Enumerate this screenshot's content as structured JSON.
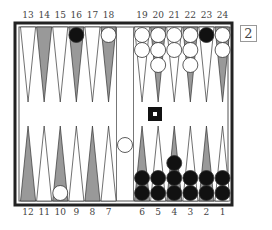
{
  "board": {
    "top_labels": [
      "13",
      "14",
      "15",
      "16",
      "17",
      "18",
      "19",
      "20",
      "21",
      "22",
      "23",
      "24"
    ],
    "bottom_labels": [
      "12",
      "11",
      "10",
      "9",
      "8",
      "7",
      "6",
      "5",
      "4",
      "3",
      "2",
      "1"
    ],
    "colors": {
      "frame": "#222222",
      "light_point": "#ffffff",
      "dark_point": "#999999",
      "white_checker": "#ffffff",
      "black_checker": "#111111",
      "background": "#ffffff"
    },
    "checkers": [
      {
        "point": 16,
        "color": "black",
        "count": 1
      },
      {
        "point": 18,
        "color": "white",
        "count": 1
      },
      {
        "point": 19,
        "color": "white",
        "count": 2
      },
      {
        "point": 20,
        "color": "white",
        "count": 3
      },
      {
        "point": 21,
        "color": "white",
        "count": 2
      },
      {
        "point": 22,
        "color": "white",
        "count": 3
      },
      {
        "point": 23,
        "color": "black",
        "count": 1
      },
      {
        "point": 24,
        "color": "white",
        "count": 2
      },
      {
        "point": 10,
        "color": "white",
        "count": 1
      },
      {
        "point": 6,
        "color": "black",
        "count": 2
      },
      {
        "point": 5,
        "color": "black",
        "count": 2
      },
      {
        "point": 4,
        "color": "black",
        "count": 3
      },
      {
        "point": 3,
        "color": "black",
        "count": 2
      },
      {
        "point": 2,
        "color": "black",
        "count": 2
      },
      {
        "point": 1,
        "color": "black",
        "count": 2
      }
    ],
    "bar": [
      {
        "color": "white",
        "count": 1
      }
    ],
    "turn_marker": "black-square-with-dot"
  },
  "cube": {
    "value": "2"
  }
}
